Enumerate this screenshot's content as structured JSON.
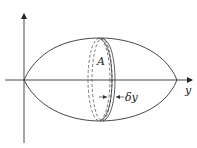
{
  "diagram": {
    "type": "solid of revolution with cross-sectional disk element",
    "axes": {
      "horizontal_label": "y",
      "vertical_label": ""
    },
    "labels": {
      "area": "A",
      "thickness": "δy"
    },
    "colors": {
      "stroke": "#333333",
      "background": "#ffffff"
    }
  }
}
